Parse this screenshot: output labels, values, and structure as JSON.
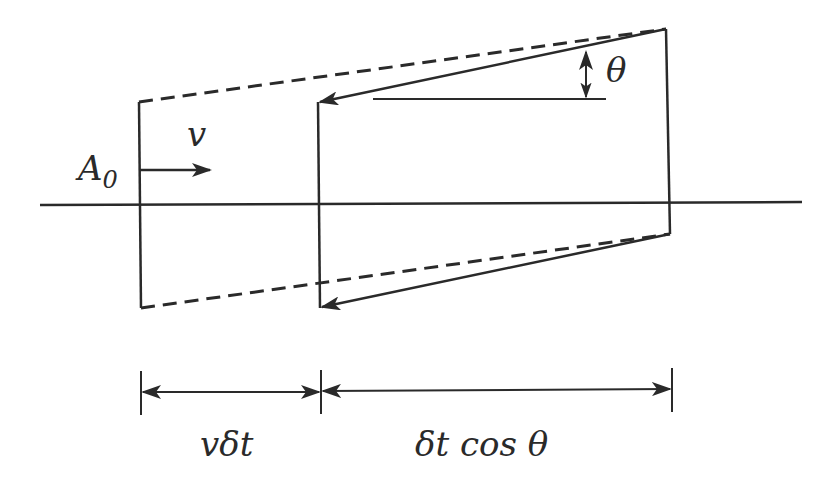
{
  "diagram": {
    "type": "geometric-flow-diagram",
    "stroke_color": "#2a2a2a",
    "background": "#ffffff",
    "labels": {
      "area": "A",
      "area_subscript": "0",
      "velocity": "v",
      "angle": "θ",
      "left_dimension": "vδt",
      "right_dimension": "δt cos θ"
    },
    "elements": [
      {
        "id": "axis",
        "kind": "horizontal-line",
        "style": "solid"
      },
      {
        "id": "initial-face",
        "kind": "vertical-line",
        "style": "solid"
      },
      {
        "id": "displaced-face",
        "kind": "vertical-line",
        "style": "solid"
      },
      {
        "id": "upper-dashed-edge",
        "kind": "line",
        "style": "dashed"
      },
      {
        "id": "lower-dashed-edge",
        "kind": "line",
        "style": "dashed"
      },
      {
        "id": "upper-slanted-arrow",
        "kind": "arrow",
        "style": "solid"
      },
      {
        "id": "lower-slanted-arrow",
        "kind": "arrow",
        "style": "solid"
      },
      {
        "id": "velocity-arrow",
        "kind": "arrow",
        "style": "solid"
      },
      {
        "id": "angle-reference-line",
        "kind": "horizontal-line",
        "style": "solid"
      },
      {
        "id": "angle-double-arrow",
        "kind": "double-arrow",
        "style": "solid"
      },
      {
        "id": "dimension-vdt",
        "kind": "dimension-arrow"
      },
      {
        "id": "dimension-dtcos",
        "kind": "dimension-arrow"
      }
    ]
  }
}
